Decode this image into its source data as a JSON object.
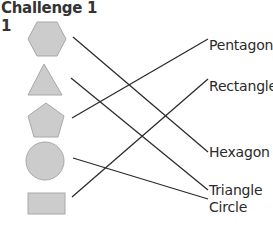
{
  "header": {
    "title": "Challenge 1",
    "question_number": "1"
  },
  "shapes": [
    {
      "name": "hexagon",
      "fill": "#cccccc",
      "stroke": "#a8a8a8"
    },
    {
      "name": "triangle",
      "fill": "#cccccc",
      "stroke": "#a8a8a8"
    },
    {
      "name": "pentagon",
      "fill": "#cccccc",
      "stroke": "#a8a8a8"
    },
    {
      "name": "circle",
      "fill": "#cccccc",
      "stroke": "#a8a8a8"
    },
    {
      "name": "rectangle",
      "fill": "#cccccc",
      "stroke": "#a8a8a8"
    }
  ],
  "labels": [
    {
      "text": "Pentagon"
    },
    {
      "text": "Rectangle"
    },
    {
      "text": "Hexagon"
    },
    {
      "text": "Triangle"
    },
    {
      "text": "Circle"
    }
  ],
  "connections": [
    {
      "from": "hexagon",
      "to": "Hexagon"
    },
    {
      "from": "triangle",
      "to": "Triangle"
    },
    {
      "from": "pentagon",
      "to": "Pentagon"
    },
    {
      "from": "circle",
      "to": "Circle"
    },
    {
      "from": "rectangle",
      "to": "Rectangle"
    }
  ],
  "colors": {
    "line": "#2b2b2b",
    "shape_fill": "#cccccc",
    "shape_stroke": "#a8a8a8",
    "text": "#2a2a2a"
  }
}
